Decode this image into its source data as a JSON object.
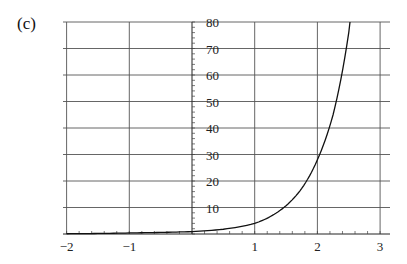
{
  "panel_label": "(c)",
  "chart_data": {
    "type": "line",
    "title": "",
    "xlabel": "",
    "ylabel": "",
    "xlim": [
      -2,
      3
    ],
    "ylim": [
      0,
      80
    ],
    "grid": true,
    "x_ticks": [
      "-2",
      "-1",
      "1",
      "2",
      "3"
    ],
    "y_ticks": [
      "10",
      "20",
      "30",
      "40",
      "50",
      "60",
      "70",
      "80"
    ],
    "series": [
      {
        "name": "curve",
        "x": [
          -2,
          -1.5,
          -1,
          -0.5,
          0,
          0.5,
          1,
          1.25,
          1.5,
          1.75,
          2,
          2.25,
          2.5,
          2.52
        ],
        "values": [
          0.1,
          0.2,
          0.4,
          0.6,
          0.9,
          1.8,
          4,
          6.6,
          10.7,
          17.2,
          28,
          45,
          76,
          80
        ]
      }
    ]
  }
}
